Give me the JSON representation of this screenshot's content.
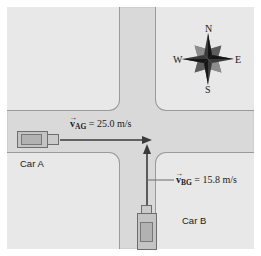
{
  "figure": {
    "canvas": {
      "width": 261,
      "height": 256
    },
    "background_color": "#ffffff",
    "road_color": "#d9d9d9",
    "block_color": "#e8e8e8",
    "block_outline_color": "#9a9a9a",
    "arrow_color": "#3a3a3a",
    "text_color": "#1a1a1a"
  },
  "velocities": {
    "car_a": {
      "symbol": "v",
      "vector_bar": "→",
      "subscript": "AG",
      "equals": "=",
      "value": "25.0",
      "units": "m/s",
      "full_text": "= 25.0 m/s",
      "direction": "east"
    },
    "car_b": {
      "symbol": "v",
      "vector_bar": "→",
      "subscript": "BG",
      "equals": "=",
      "value": "15.8",
      "units": "m/s",
      "full_text": "= 15.8 m/s",
      "direction": "north"
    }
  },
  "labels": {
    "car_a": "Car A",
    "car_b": "Car B"
  },
  "compass": {
    "north": "N",
    "east": "E",
    "south": "S",
    "west": "W",
    "icon": "compass-rose-star-icon"
  },
  "icons": {
    "arrow_a": "arrow-right-icon",
    "arrow_b": "arrow-up-icon",
    "car_a": "car-top-view-icon",
    "car_b": "car-top-view-icon"
  }
}
